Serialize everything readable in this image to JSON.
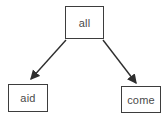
{
  "diagram": {
    "type": "tree",
    "root": {
      "label": "all"
    },
    "children": [
      {
        "label": "aid"
      },
      {
        "label": "come"
      }
    ],
    "edges": [
      {
        "from": "all",
        "to": "aid",
        "directed": true
      },
      {
        "from": "all",
        "to": "come",
        "directed": true
      }
    ],
    "colors": {
      "background": "#ffffff",
      "node_fill": "#ffffff",
      "node_border": "#3d3d3d",
      "text": "#4a4a4a",
      "arrow": "#2e2e2e"
    }
  }
}
